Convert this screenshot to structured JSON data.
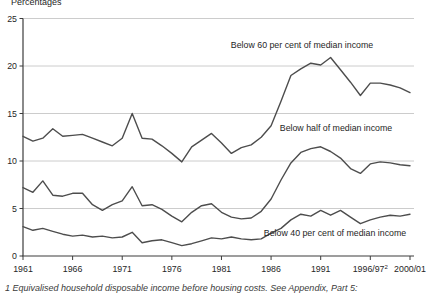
{
  "page": {
    "y_axis_title": "Percentages",
    "footnote": "1 Equivalised household disposable income before housing costs. See Appendix, Part 5:"
  },
  "chart_data": {
    "type": "line",
    "title": "",
    "ylabel": "Percentages",
    "xlabel": "",
    "ylim": [
      0,
      25
    ],
    "y_ticks": [
      0,
      5,
      10,
      15,
      20,
      25
    ],
    "grid": "horizontal",
    "legend_position": "inline-annotations",
    "line_color": "#4d4d4d",
    "grid_color": "#cccccc",
    "axis_color": "#3c3c3c",
    "text_color": "#262626",
    "x": [
      "1961",
      "1962",
      "1963",
      "1964",
      "1965",
      "1966",
      "1967",
      "1968",
      "1969",
      "1970",
      "1971",
      "1972",
      "1973",
      "1974",
      "1975",
      "1976",
      "1977",
      "1978",
      "1979",
      "1980",
      "1981",
      "1982",
      "1983",
      "1984",
      "1985",
      "1986",
      "1987",
      "1988",
      "1989",
      "1990",
      "1991",
      "1992",
      "1993",
      "1994/95",
      "1995/96",
      "1996/97",
      "1997/98",
      "1998/99",
      "1999/00",
      "2000/01"
    ],
    "x_ticks": [
      {
        "label": "1961",
        "index": 0
      },
      {
        "label": "1966",
        "index": 5
      },
      {
        "label": "1971",
        "index": 10
      },
      {
        "label": "1976",
        "index": 15
      },
      {
        "label": "1981",
        "index": 20
      },
      {
        "label": "1986",
        "index": 25
      },
      {
        "label": "1991",
        "index": 30
      },
      {
        "label": "1996/97",
        "sup": "2",
        "index": 35
      },
      {
        "label": "2000/01",
        "index": 39
      }
    ],
    "series": [
      {
        "name": "Below 60 per cent of median income",
        "values": [
          12.6,
          12.1,
          12.4,
          13.4,
          12.6,
          12.7,
          12.8,
          12.4,
          12.0,
          11.6,
          12.4,
          15.0,
          12.4,
          12.3,
          11.6,
          10.8,
          9.9,
          11.5,
          12.2,
          12.9,
          11.9,
          10.8,
          11.4,
          11.7,
          12.5,
          13.7,
          16.3,
          19.0,
          19.7,
          20.3,
          20.1,
          20.9,
          19.6,
          18.3,
          16.9,
          18.2,
          18.2,
          18.0,
          17.7,
          17.2
        ],
        "label_anchor": {
          "x": 302,
          "y": 48
        }
      },
      {
        "name": "Below half of median income",
        "values": [
          7.2,
          6.7,
          7.9,
          6.4,
          6.3,
          6.6,
          6.6,
          5.4,
          4.8,
          5.4,
          5.8,
          7.3,
          5.3,
          5.4,
          4.9,
          4.2,
          3.6,
          4.6,
          5.3,
          5.5,
          4.6,
          4.1,
          3.9,
          4.0,
          4.7,
          6.0,
          8.0,
          9.8,
          10.9,
          11.3,
          11.5,
          11.0,
          10.3,
          9.2,
          8.7,
          9.7,
          9.9,
          9.8,
          9.6,
          9.5
        ],
        "label_anchor": {
          "x": 336,
          "y": 131
        }
      },
      {
        "name": "Below 40 per cent of median income",
        "values": [
          3.1,
          2.7,
          2.9,
          2.6,
          2.3,
          2.1,
          2.2,
          2.0,
          2.1,
          1.9,
          2.0,
          2.5,
          1.4,
          1.6,
          1.7,
          1.4,
          1.1,
          1.3,
          1.6,
          1.9,
          1.8,
          2.0,
          1.8,
          1.7,
          1.8,
          2.4,
          2.9,
          3.8,
          4.4,
          4.2,
          4.8,
          4.3,
          4.8,
          4.1,
          3.4,
          3.8,
          4.1,
          4.3,
          4.2,
          4.4
        ],
        "label_anchor": {
          "x": 335,
          "y": 236
        }
      }
    ]
  }
}
